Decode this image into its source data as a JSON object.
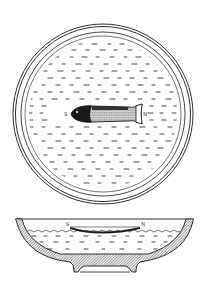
{
  "illustration": {
    "top_view": {
      "labels": {
        "south": "S",
        "north": "N"
      }
    },
    "side_view": {
      "labels": {
        "south": "S",
        "north": "N"
      }
    }
  },
  "colors": {
    "ink": "#1a1a1a",
    "paper": "#ffffff"
  }
}
